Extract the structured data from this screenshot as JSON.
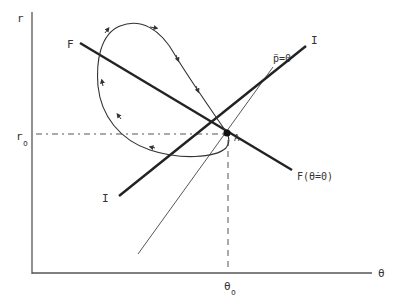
{
  "diagram": {
    "axes": {
      "y_label": "r",
      "x_label": "θ",
      "y_equilibrium_label": "r",
      "y_equilibrium_sub": "o",
      "x_equilibrium_label": "θ",
      "x_equilibrium_sub": "o"
    },
    "point": {
      "label": "A"
    },
    "lines": {
      "F_left_label": "F",
      "F_right_label": "F(θ̇=0)",
      "I_left_label": "I",
      "I_right_label": "I",
      "p_label": "p̈=0"
    },
    "colors": {
      "ink": "#222222",
      "thin": "#444444",
      "label": "#333333"
    }
  }
}
